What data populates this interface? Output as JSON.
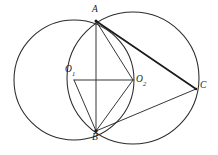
{
  "figure": {
    "width": 218,
    "height": 155,
    "background_color": "#ffffff",
    "stroke_color": "#2b2b2b"
  },
  "labels": {
    "a": "A",
    "b": "B",
    "c": "C",
    "o1_base": "O",
    "o1_sub": "1",
    "o2_base": "O",
    "o2_sub": "2"
  },
  "points": [
    {
      "name": "A",
      "x": 96,
      "y": 21,
      "label": "A",
      "label_x": 92,
      "label_y": 6
    },
    {
      "name": "B",
      "x": 96,
      "y": 131,
      "label": "B",
      "label_x": 92,
      "label_y": 134
    },
    {
      "name": "C",
      "x": 196,
      "y": 89,
      "label": "C",
      "label_x": 200,
      "label_y": 82
    },
    {
      "name": "O1",
      "x": 74,
      "y": 80,
      "label": "O1",
      "label_x": 66,
      "label_y": 66
    },
    {
      "name": "O2",
      "x": 133,
      "y": 80,
      "label": "O2",
      "label_x": 136,
      "label_y": 76
    }
  ],
  "circles": [
    {
      "name": "left-circle",
      "center": "O1",
      "cx": 74,
      "cy": 80,
      "r": 60
    },
    {
      "name": "right-circle",
      "center": "O2",
      "cx": 133,
      "cy": 78,
      "r": 66
    }
  ],
  "segments": [
    {
      "name": "AB",
      "from": "A",
      "to": "B",
      "weight": "thin"
    },
    {
      "name": "AC",
      "from": "A",
      "to": "C",
      "weight": "thick"
    },
    {
      "name": "BC",
      "from": "B",
      "to": "C",
      "weight": "thin"
    },
    {
      "name": "O1O2",
      "from": "O1",
      "to": "O2",
      "weight": "thin"
    },
    {
      "name": "O1B",
      "from": "O1",
      "to": "B",
      "weight": "thin"
    },
    {
      "name": "O2B",
      "from": "O2",
      "to": "B",
      "weight": "thin"
    },
    {
      "name": "O2A",
      "from": "O2",
      "to": "A",
      "weight": "thin"
    }
  ]
}
